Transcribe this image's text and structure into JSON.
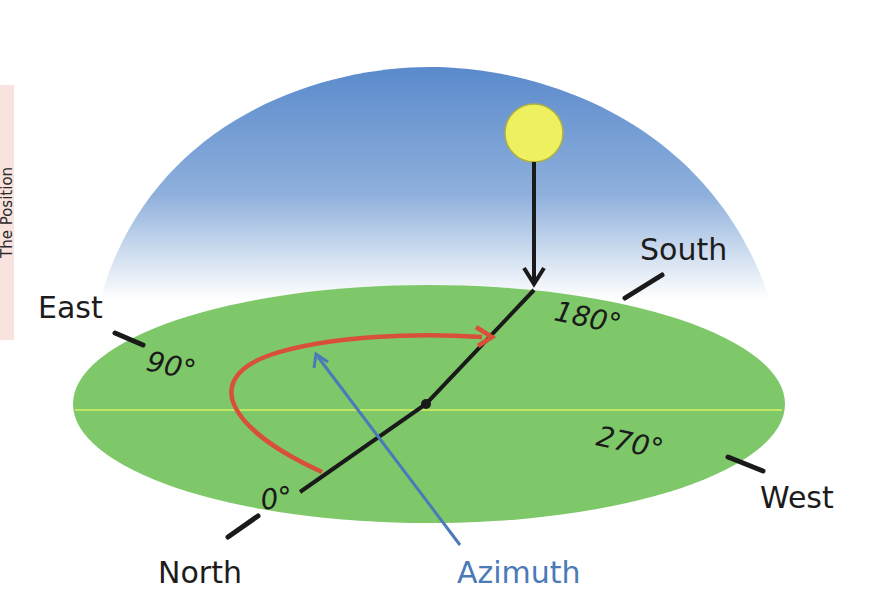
{
  "side_label": "The Position",
  "colors": {
    "sky_top": "#5a8acc",
    "sky_bottom": "#ffffff",
    "ground": "#7ec86a",
    "horizon_line": "#d8f060",
    "sun": "#eef060",
    "azimuth_arc": "#d9503a",
    "azimuth_pointer": "#4a7ab8"
  },
  "directions": {
    "north": "North",
    "east": "East",
    "south": "South",
    "west": "West"
  },
  "degrees": {
    "north": "0°",
    "east": "90°",
    "south": "180°",
    "west": "270°"
  },
  "azimuth_label": "Azimuth",
  "icons": {
    "sun": "sun-icon",
    "shadow_arrow": "arrow-down-icon"
  }
}
